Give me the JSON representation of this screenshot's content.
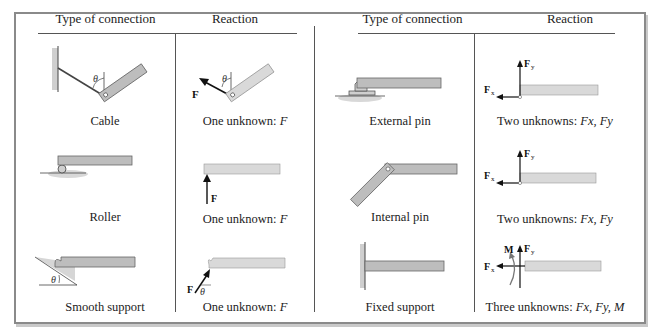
{
  "headers": {
    "left_type": "Type of connection",
    "left_reaction": "Reaction",
    "right_type": "Type of connection",
    "right_reaction": "Reaction"
  },
  "rows": [
    {
      "left": {
        "connection": "Cable",
        "reaction_prefix": "One unknown: ",
        "reaction_vars": "F",
        "symbols": {
          "force": "F",
          "angle": "θ"
        }
      },
      "right": {
        "connection": "External pin",
        "reaction_prefix": "Two unknowns: ",
        "reaction_vars": "Fx, Fy",
        "symbols": {
          "fx": "F",
          "fx_sub": "x",
          "fy": "F",
          "fy_sub": "y"
        }
      }
    },
    {
      "left": {
        "connection": "Roller",
        "reaction_prefix": "One unknown: ",
        "reaction_vars": "F",
        "symbols": {
          "force": "F"
        }
      },
      "right": {
        "connection": "Internal pin",
        "reaction_prefix": "Two unknowns: ",
        "reaction_vars": "Fx, Fy",
        "symbols": {
          "fx": "F",
          "fx_sub": "x",
          "fy": "F",
          "fy_sub": "y"
        }
      }
    },
    {
      "left": {
        "connection": "Smooth support",
        "reaction_prefix": "One unknown: ",
        "reaction_vars": "F",
        "symbols": {
          "force": "F",
          "angle": "θ"
        }
      },
      "right": {
        "connection": "Fixed support",
        "reaction_prefix": "Three unknowns: ",
        "reaction_vars": "Fx, Fy, M",
        "symbols": {
          "fx": "F",
          "fx_sub": "x",
          "fy": "F",
          "fy_sub": "y",
          "moment": "M"
        }
      }
    }
  ],
  "colors": {
    "member_fill": "#bdbdbd",
    "member_reaction_fill": "#d9d9d9",
    "member_edge": "#666666",
    "line": "#555555",
    "frame": "#8a8a8a"
  }
}
